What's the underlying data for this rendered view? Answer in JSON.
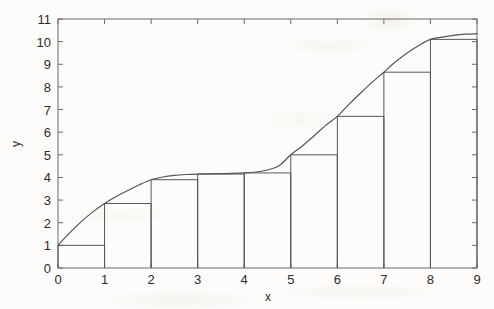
{
  "chart_data": {
    "type": "area",
    "title": "",
    "subtitle": "",
    "xlabel": "x",
    "ylabel": "y",
    "xlim": [
      0,
      9
    ],
    "ylim": [
      0,
      11
    ],
    "xticks": [
      0,
      1,
      2,
      3,
      4,
      5,
      6,
      7,
      8,
      9
    ],
    "yticks": [
      0,
      1,
      2,
      3,
      4,
      5,
      6,
      7,
      8,
      9,
      10,
      11
    ],
    "xticklabels": [
      "0",
      "1",
      "2",
      "3",
      "4",
      "5",
      "6",
      "7",
      "8",
      "9"
    ],
    "yticklabels": [
      "0",
      "1",
      "2",
      "3",
      "4",
      "5",
      "6",
      "7",
      "8",
      "9",
      "10",
      "11"
    ],
    "grid": false,
    "legend": null,
    "annotations": [],
    "series": [
      {
        "name": "curve",
        "type": "line",
        "color": "#555555",
        "x": [
          0,
          0.25,
          0.5,
          0.75,
          1,
          1.25,
          1.5,
          1.75,
          2,
          2.25,
          2.5,
          2.75,
          3,
          3.25,
          3.5,
          3.75,
          4,
          4.25,
          4.5,
          4.75,
          5,
          5.25,
          5.5,
          5.75,
          6,
          6.25,
          6.5,
          6.75,
          7,
          7.25,
          7.5,
          7.75,
          8,
          8.25,
          8.5,
          8.75,
          9
        ],
        "y": [
          1.0,
          1.55,
          2.05,
          2.48,
          2.85,
          3.16,
          3.42,
          3.68,
          3.9,
          4.02,
          4.09,
          4.13,
          4.15,
          4.16,
          4.17,
          4.18,
          4.2,
          4.24,
          4.33,
          4.52,
          5.0,
          5.39,
          5.84,
          6.3,
          6.7,
          7.23,
          7.73,
          8.21,
          8.65,
          9.11,
          9.5,
          9.83,
          10.1,
          10.2,
          10.28,
          10.33,
          10.35
        ]
      },
      {
        "name": "left-endpoint Riemann rectangles",
        "type": "bar",
        "color": "#555555",
        "fill": "none",
        "bar_left_edges": [
          0,
          1,
          2,
          3,
          4,
          5,
          6,
          7,
          8
        ],
        "bar_width": 1,
        "categories": [
          "0-1",
          "1-2",
          "2-3",
          "3-4",
          "4-5",
          "5-6",
          "6-7",
          "7-8",
          "8-9"
        ],
        "values": [
          1.0,
          2.85,
          3.9,
          4.15,
          4.2,
          5.0,
          6.7,
          8.65,
          10.1
        ]
      }
    ]
  },
  "axes": {
    "x_title": "x",
    "y_title": "y"
  },
  "colors": {
    "line": "#555555",
    "axis": "#6b6b6b",
    "text": "#2b2b2b",
    "background": "#fdfcfa"
  }
}
